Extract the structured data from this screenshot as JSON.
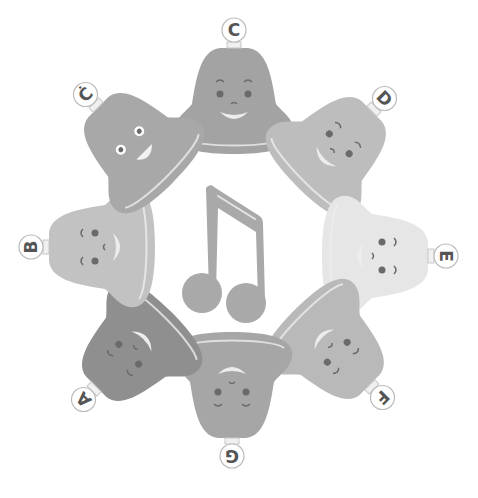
{
  "center_icon": "beamed-eighth-notes-icon",
  "colors": {
    "background": "#ffffff",
    "face_feature": "#6a6a6a",
    "highlight": "#eeeeee",
    "label_ring": "#bbbbbb",
    "label_text": "#555555",
    "note": "#a9a9a9"
  },
  "bells": [
    {
      "note": "C",
      "cx": 234,
      "cy": 100,
      "angle": 0,
      "fill": "#a3a3a3",
      "face": "smile-up"
    },
    {
      "note": "D",
      "cx": 335,
      "cy": 148,
      "angle": 45,
      "fill": "#bdbdbd",
      "face": "smile-side"
    },
    {
      "note": "E",
      "cx": 376,
      "cy": 256,
      "angle": 90,
      "fill": "#e6e6e6",
      "face": "smile-side"
    },
    {
      "note": "F",
      "cx": 333,
      "cy": 348,
      "angle": 135,
      "fill": "#b9b9b9",
      "face": "smile-side"
    },
    {
      "note": "G",
      "cx": 232,
      "cy": 386,
      "angle": 180,
      "fill": "#a6a6a6",
      "face": "smile-side"
    },
    {
      "note": "A",
      "cx": 133,
      "cy": 350,
      "angle": 225,
      "fill": "#8f8f8f",
      "face": "smile-side"
    },
    {
      "note": "B",
      "cx": 101,
      "cy": 247,
      "angle": 270,
      "fill": "#c2c2c2",
      "face": "smile-side"
    },
    {
      "note": "Ċ",
      "cx": 135,
      "cy": 144,
      "angle": 315,
      "fill": "#a8a8a8",
      "face": "wide-eyes"
    }
  ]
}
